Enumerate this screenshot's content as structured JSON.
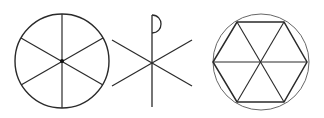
{
  "figure": {
    "width": 324,
    "height": 118,
    "stroke_color": "#2a2a2a",
    "light_stroke_color": "#555555",
    "symbols": [
      {
        "name": "six-spoked-wheel",
        "circle": {
          "cx": 62,
          "cy": 61,
          "r": 47
        },
        "spokes": [
          {
            "x1": 62,
            "y1": 14,
            "x2": 62,
            "y2": 108
          },
          {
            "x1": 21,
            "y1": 38,
            "x2": 103,
            "y2": 85
          },
          {
            "x1": 21,
            "y1": 85,
            "x2": 103,
            "y2": 38
          }
        ],
        "hub": {
          "cx": 62,
          "cy": 61,
          "r": 2
        }
      },
      {
        "name": "chi-rho",
        "staff": {
          "x1": 152,
          "y1": 15,
          "x2": 152,
          "y2": 107
        },
        "rho_loop": "M152,15 C164,15 164,33 152,33",
        "x_arms": [
          {
            "x1": 112,
            "y1": 40,
            "x2": 192,
            "y2": 86
          },
          {
            "x1": 112,
            "y1": 86,
            "x2": 192,
            "y2": 40
          }
        ]
      },
      {
        "name": "hexagon-in-circle",
        "circle": {
          "cx": 261,
          "cy": 62,
          "r": 48
        },
        "hexagon": "237,22 284,22 307,62 284,102 237,102 213,62",
        "diagonals": [
          {
            "x1": 213,
            "y1": 62,
            "x2": 307,
            "y2": 62
          },
          {
            "x1": 237,
            "y1": 22,
            "x2": 284,
            "y2": 102
          },
          {
            "x1": 284,
            "y1": 22,
            "x2": 237,
            "y2": 102
          }
        ]
      }
    ]
  }
}
